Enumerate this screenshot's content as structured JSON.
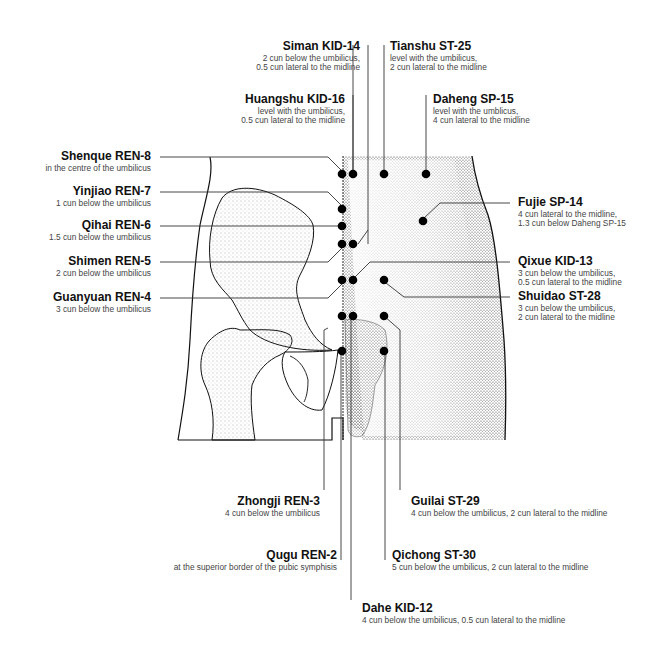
{
  "diagram": {
    "points": [
      {
        "id": "siman",
        "name": "Siman KID-14",
        "desc": [
          "2 cun below the umbilicus,",
          "0.5 cun lateral to the midline"
        ]
      },
      {
        "id": "tianshu",
        "name": "Tianshu ST-25",
        "desc": [
          "level with the umbilicus,",
          "2 cun lateral to the midline"
        ]
      },
      {
        "id": "huangshu",
        "name": "Huangshu KID-16",
        "desc": [
          "level with the umbilicus,",
          "0.5 cun lateral to the midline"
        ]
      },
      {
        "id": "daheng",
        "name": "Daheng SP-15",
        "desc": [
          "level with the umblicus,",
          "4 cun lateral to the midline"
        ]
      },
      {
        "id": "shenque",
        "name": "Shenque REN-8",
        "desc": [
          "in the centre of the umbilicus"
        ]
      },
      {
        "id": "yinjiao",
        "name": "Yinjiao REN-7",
        "desc": [
          "1 cun below the umbilicus"
        ]
      },
      {
        "id": "qihai",
        "name": "Qihai REN-6",
        "desc": [
          "1.5 cun below the umbilicus"
        ]
      },
      {
        "id": "shimen",
        "name": "Shimen REN-5",
        "desc": [
          "2 cun below the umbilicus"
        ]
      },
      {
        "id": "guanyuan",
        "name": "Guanyuan REN-4",
        "desc": [
          "3 cun below the umbilicus"
        ]
      },
      {
        "id": "fujie",
        "name": "Fujie SP-14",
        "desc": [
          "4 cun lateral to the midline,",
          "1.3 cun below Daheng SP-15"
        ]
      },
      {
        "id": "qixue",
        "name": "Qixue KID-13",
        "desc": [
          "3 cun below the umbilicus,",
          "0.5 cun lateral to the midline"
        ]
      },
      {
        "id": "shuidao",
        "name": "Shuidao ST-28",
        "desc": [
          "3 cun below the umbilicus,",
          "2 cun lateral to the midline"
        ]
      },
      {
        "id": "zhongji",
        "name": "Zhongji REN-3",
        "desc": [
          "4 cun below the umbilicus"
        ]
      },
      {
        "id": "guilai",
        "name": "Guilai ST-29",
        "desc": [
          "4 cun below the umbilicus, 2 cun lateral to the midline"
        ]
      },
      {
        "id": "qugu",
        "name": "Qugu REN-2",
        "desc": [
          "at the superior border of the pubic symphisis"
        ]
      },
      {
        "id": "qichong",
        "name": "Qichong ST-30",
        "desc": [
          "5 cun below the umbilicus, 2 cun lateral to the midline"
        ]
      },
      {
        "id": "dahe",
        "name": "Dahe KID-12",
        "desc": [
          "4 cun below the umbilicus, 0.5 cun lateral to the midline"
        ]
      }
    ]
  }
}
